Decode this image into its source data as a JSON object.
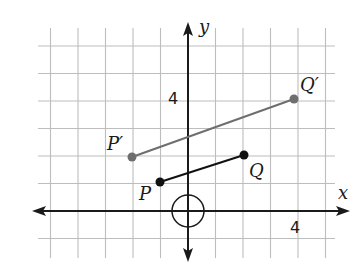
{
  "diagram": {
    "grid": {
      "x_min": -5,
      "x_max": 5,
      "y_min": -1,
      "y_max": 6,
      "unit_px": 27.5,
      "origin_px": [
        188,
        211
      ],
      "color": "#bdbdbd"
    },
    "axes": {
      "x_label": "x",
      "y_label": "y",
      "x_tick_label": "4",
      "y_tick_label": "4",
      "color": "#1a1a1a"
    },
    "center_marker": {
      "shape": "circle",
      "at": [
        0,
        0
      ],
      "radius_units": 0.6
    },
    "segments": [
      {
        "name": "PQ",
        "color": "#111111",
        "start": {
          "label": "P",
          "coords": [
            -1,
            1
          ]
        },
        "end": {
          "label": "Q",
          "coords": [
            2,
            2
          ]
        }
      },
      {
        "name": "P'Q'",
        "color": "#6e6e6e",
        "start": {
          "label": "P′",
          "coords": [
            -2,
            2
          ]
        },
        "end": {
          "label": "Q′",
          "coords": [
            4,
            4
          ]
        }
      }
    ]
  }
}
